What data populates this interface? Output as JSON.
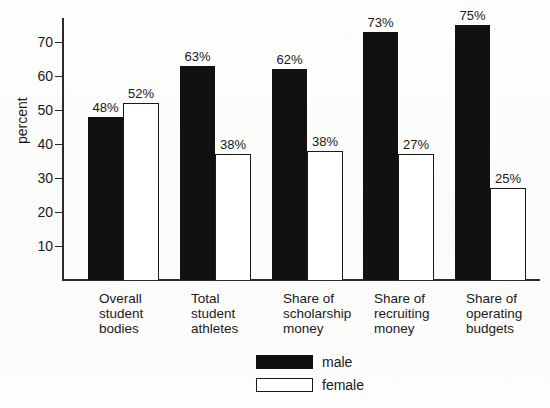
{
  "chart_data": {
    "type": "bar",
    "title": "",
    "xlabel": "",
    "ylabel": "percent",
    "ylim": [
      0,
      78
    ],
    "grid": false,
    "legend_position": "bottom-center",
    "y_ticks": [
      10,
      20,
      30,
      40,
      50,
      60,
      70
    ],
    "categories": [
      "Overall\nstudent\nbodies",
      "Total\nstudent\nathletes",
      "Share of\nscholarship\nmoney",
      "Share of\nrecruiting\nmoney",
      "Share of\noperating\nbudgets"
    ],
    "series": [
      {
        "name": "male",
        "color": "#111111",
        "values": [
          48,
          63,
          62,
          73,
          75
        ],
        "labels": [
          "48%",
          "63%",
          "62%",
          "73%",
          "75%"
        ],
        "drawn_values": [
          48,
          63,
          62,
          73,
          75
        ]
      },
      {
        "name": "female",
        "color": "#ffffff",
        "values": [
          52,
          37,
          38,
          27,
          25
        ],
        "labels": [
          "52%",
          "38%",
          "38%",
          "27%",
          "25%"
        ],
        "drawn_values": [
          52,
          37,
          38,
          37,
          27
        ]
      }
    ],
    "data_label_suffix": "%"
  },
  "legend": {
    "items": [
      {
        "label": "male",
        "swatch": "filled-black"
      },
      {
        "label": "female",
        "swatch": "outlined-white"
      }
    ]
  },
  "axis": {
    "y_title": "percent",
    "tick_labels": [
      "70",
      "60",
      "50",
      "40",
      "30",
      "20",
      "10"
    ]
  },
  "colors": {
    "ink": "#1a1a1a",
    "bar_male": "#111111",
    "bar_female": "#ffffff",
    "background": "#fdfdfc"
  }
}
